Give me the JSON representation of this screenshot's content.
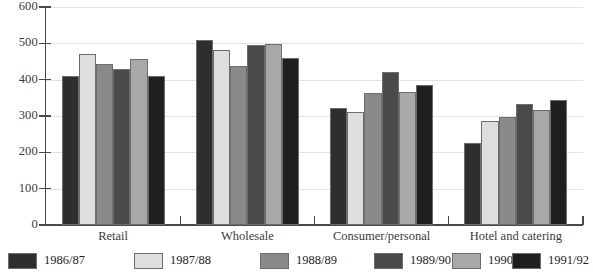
{
  "chart_data": {
    "type": "bar",
    "title": "",
    "subtitle": "",
    "xlabel": "",
    "ylabel": "",
    "ylim": [
      0,
      600
    ],
    "y_ticks": [
      0,
      100,
      200,
      300,
      400,
      500,
      600
    ],
    "grid": true,
    "legend_position": "bottom",
    "categories": [
      "Retail",
      "Wholesale",
      "Consumer/personal",
      "Hotel and catering"
    ],
    "series": [
      {
        "name": "1986/87",
        "color": "#2e2e2e",
        "values": [
          410,
          510,
          323,
          227
        ]
      },
      {
        "name": "1987/88",
        "color": "#dedede",
        "values": [
          472,
          481,
          312,
          287
        ]
      },
      {
        "name": "1988/89",
        "color": "#8a8a8a",
        "values": [
          442,
          438,
          362,
          296
        ]
      },
      {
        "name": "1989/90",
        "color": "#4a4a4a",
        "values": [
          429,
          496,
          422,
          334
        ]
      },
      {
        "name": "1990/91",
        "color": "#a8a8a8",
        "values": [
          458,
          499,
          367,
          317
        ]
      },
      {
        "name": "1991/92",
        "color": "#1f1f1f",
        "values": [
          409,
          459,
          386,
          344
        ]
      }
    ]
  },
  "axis": {
    "y_tick_labels": [
      "600",
      "500",
      "400",
      "300",
      "200",
      "100",
      "0"
    ]
  },
  "legend": {
    "items": [
      {
        "label": "1986/87",
        "color": "#2e2e2e"
      },
      {
        "label": "1987/88",
        "color": "#dedede"
      },
      {
        "label": "1988/89",
        "color": "#8a8a8a"
      },
      {
        "label": "1989/90",
        "color": "#4a4a4a"
      },
      {
        "label": "1990/91",
        "color": "#a8a8a8"
      },
      {
        "label": "1991/92",
        "color": "#1f1f1f"
      }
    ]
  }
}
